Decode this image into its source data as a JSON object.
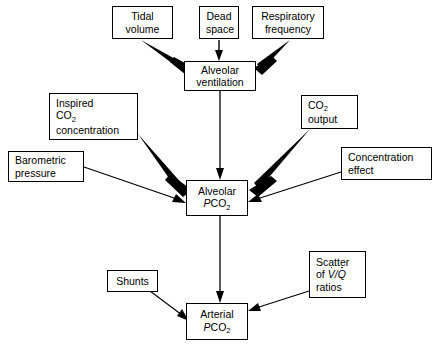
{
  "diagram": {
    "background_color": "#ffffff",
    "line_color": "#000000",
    "nodes": {
      "tidal_volume": {
        "lines": [
          "Tidal",
          "volume"
        ]
      },
      "dead_space": {
        "lines": [
          "Dead",
          "space"
        ]
      },
      "respiratory_frequency": {
        "lines": [
          "Respiratory",
          "frequency"
        ]
      },
      "alveolar_ventilation": {
        "lines": [
          "Alveolar",
          "ventilation"
        ]
      },
      "inspired_co2": {
        "lines": [
          "Inspired",
          "CO2",
          "concentration"
        ]
      },
      "co2_output": {
        "lines": [
          "CO2",
          "output"
        ]
      },
      "barometric_pressure": {
        "lines": [
          "Barometric",
          "pressure"
        ]
      },
      "concentration_effect": {
        "lines": [
          "Concentration",
          "effect"
        ]
      },
      "alveolar_pco2": {
        "lines": [
          "Alveolar",
          "PCO2"
        ]
      },
      "shunts": {
        "lines": [
          "Shunts"
        ]
      },
      "scatter_vq": {
        "lines": [
          "Scatter",
          "of V/Q",
          "ratios"
        ]
      },
      "arterial_pco2": {
        "lines": [
          "Arterial",
          "PCO2"
        ]
      }
    },
    "edges": [
      {
        "from": "tidal_volume",
        "to": "alveolar_ventilation",
        "weight": "thick"
      },
      {
        "from": "dead_space",
        "to": "alveolar_ventilation",
        "weight": "thin"
      },
      {
        "from": "respiratory_frequency",
        "to": "alveolar_ventilation",
        "weight": "thick"
      },
      {
        "from": "alveolar_ventilation",
        "to": "alveolar_pco2",
        "weight": "thin"
      },
      {
        "from": "inspired_co2",
        "to": "alveolar_pco2",
        "weight": "thick"
      },
      {
        "from": "co2_output",
        "to": "alveolar_pco2",
        "weight": "thick"
      },
      {
        "from": "barometric_pressure",
        "to": "alveolar_pco2",
        "weight": "thin"
      },
      {
        "from": "concentration_effect",
        "to": "alveolar_pco2",
        "weight": "thin"
      },
      {
        "from": "alveolar_pco2",
        "to": "arterial_pco2",
        "weight": "thin"
      },
      {
        "from": "shunts",
        "to": "arterial_pco2",
        "weight": "thin"
      },
      {
        "from": "scatter_vq",
        "to": "arterial_pco2",
        "weight": "thin"
      }
    ]
  }
}
